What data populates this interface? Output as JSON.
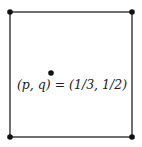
{
  "diagram": {
    "square": {
      "corners": [
        [
          10,
          12
        ],
        [
          132,
          12
        ],
        [
          132,
          137
        ],
        [
          10,
          137
        ]
      ],
      "stroke": "#222222"
    },
    "point": {
      "x": 51,
      "y": 73,
      "color": "#111111"
    },
    "label": "(p, q) = (1/3, 1/2)",
    "label_pos": {
      "x": 72,
      "y": 89
    }
  }
}
